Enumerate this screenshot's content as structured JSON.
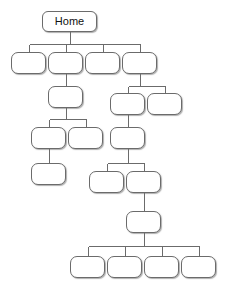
{
  "diagram": {
    "type": "sitemap-tree",
    "title": "Home",
    "canvas": {
      "width": 225,
      "height": 293,
      "background": "#ffffff"
    },
    "style": {
      "node_fill": "#ffffff",
      "node_border": "#6b6b6b",
      "edge_color": "#6b6b6b",
      "text_color": "#111111",
      "shadow_color": "rgba(110,110,110,0.55)",
      "corner_radius": 7
    },
    "nodes": [
      {
        "id": "n0",
        "label": "Home",
        "x": 42,
        "y": 11,
        "w": 55,
        "h": 21,
        "level": 0
      },
      {
        "id": "n1",
        "label": "",
        "x": 11,
        "y": 52,
        "w": 35,
        "h": 22,
        "level": 1
      },
      {
        "id": "n2",
        "label": "",
        "x": 48,
        "y": 52,
        "w": 35,
        "h": 22,
        "level": 1
      },
      {
        "id": "n3",
        "label": "",
        "x": 85,
        "y": 52,
        "w": 35,
        "h": 22,
        "level": 1
      },
      {
        "id": "n4",
        "label": "",
        "x": 122,
        "y": 52,
        "w": 35,
        "h": 22,
        "level": 1
      },
      {
        "id": "n5",
        "label": "",
        "x": 48,
        "y": 86,
        "w": 35,
        "h": 22,
        "level": 2
      },
      {
        "id": "n6",
        "label": "",
        "x": 110,
        "y": 93,
        "w": 35,
        "h": 22,
        "level": 2
      },
      {
        "id": "n7",
        "label": "",
        "x": 147,
        "y": 93,
        "w": 35,
        "h": 22,
        "level": 2
      },
      {
        "id": "n8",
        "label": "",
        "x": 31,
        "y": 127,
        "w": 35,
        "h": 22,
        "level": 3
      },
      {
        "id": "n9",
        "label": "",
        "x": 68,
        "y": 127,
        "w": 35,
        "h": 22,
        "level": 3
      },
      {
        "id": "n10",
        "label": "",
        "x": 110,
        "y": 127,
        "w": 35,
        "h": 22,
        "level": 3
      },
      {
        "id": "n11",
        "label": "",
        "x": 31,
        "y": 163,
        "w": 35,
        "h": 22,
        "level": 4
      },
      {
        "id": "n12",
        "label": "",
        "x": 89,
        "y": 171,
        "w": 35,
        "h": 22,
        "level": 4
      },
      {
        "id": "n13",
        "label": "",
        "x": 126,
        "y": 171,
        "w": 35,
        "h": 22,
        "level": 4
      },
      {
        "id": "n14",
        "label": "",
        "x": 126,
        "y": 211,
        "w": 35,
        "h": 22,
        "level": 5
      },
      {
        "id": "n15",
        "label": "",
        "x": 70,
        "y": 256,
        "w": 35,
        "h": 22,
        "level": 6
      },
      {
        "id": "n16",
        "label": "",
        "x": 107,
        "y": 256,
        "w": 35,
        "h": 22,
        "level": 6
      },
      {
        "id": "n17",
        "label": "",
        "x": 144,
        "y": 256,
        "w": 35,
        "h": 22,
        "level": 6
      },
      {
        "id": "n18",
        "label": "",
        "x": 181,
        "y": 256,
        "w": 35,
        "h": 22,
        "level": 6
      }
    ],
    "edges": [
      {
        "from": "n0",
        "to": "n1",
        "bus_y": 44
      },
      {
        "from": "n0",
        "to": "n2",
        "bus_y": 44
      },
      {
        "from": "n0",
        "to": "n3",
        "bus_y": 44
      },
      {
        "from": "n0",
        "to": "n4",
        "bus_y": 44
      },
      {
        "from": "n2",
        "to": "n5",
        "bus_y": 80
      },
      {
        "from": "n4",
        "to": "n6",
        "bus_y": 86
      },
      {
        "from": "n4",
        "to": "n7",
        "bus_y": 86
      },
      {
        "from": "n5",
        "to": "n8",
        "bus_y": 119
      },
      {
        "from": "n5",
        "to": "n9",
        "bus_y": 119
      },
      {
        "from": "n6",
        "to": "n10",
        "bus_y": 121
      },
      {
        "from": "n8",
        "to": "n11",
        "bus_y": 156
      },
      {
        "from": "n10",
        "to": "n12",
        "bus_y": 163
      },
      {
        "from": "n10",
        "to": "n13",
        "bus_y": 163
      },
      {
        "from": "n13",
        "to": "n14",
        "bus_y": 203
      },
      {
        "from": "n14",
        "to": "n15",
        "bus_y": 246
      },
      {
        "from": "n14",
        "to": "n16",
        "bus_y": 246
      },
      {
        "from": "n14",
        "to": "n17",
        "bus_y": 246
      },
      {
        "from": "n14",
        "to": "n18",
        "bus_y": 246
      }
    ]
  }
}
